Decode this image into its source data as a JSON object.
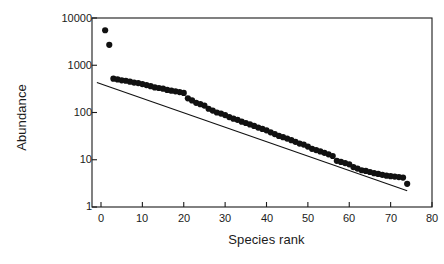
{
  "chart_data": {
    "type": "scatter",
    "title": "",
    "xlabel": "Species rank",
    "ylabel": "Abundance",
    "xlim": [
      -5,
      80
    ],
    "ylim": [
      1,
      10000
    ],
    "yscale": "log",
    "xticks": [
      0,
      10,
      20,
      30,
      40,
      50,
      60,
      70,
      80
    ],
    "yticks": [
      1,
      10,
      100,
      1000,
      10000
    ],
    "ytick_labels": [
      "1",
      "10",
      "100",
      "1000",
      "10000"
    ],
    "grid": false,
    "legend": null,
    "marker": "filled-circle",
    "marker_color": "#111111",
    "series": [
      {
        "name": "Species abundance",
        "x": [
          1,
          2,
          3,
          4,
          5,
          6,
          7,
          8,
          9,
          10,
          11,
          12,
          13,
          14,
          15,
          16,
          17,
          18,
          19,
          20,
          21,
          22,
          23,
          24,
          25,
          26,
          27,
          28,
          29,
          30,
          31,
          32,
          33,
          34,
          35,
          36,
          37,
          38,
          39,
          40,
          41,
          42,
          43,
          44,
          45,
          46,
          47,
          48,
          49,
          50,
          51,
          52,
          53,
          54,
          55,
          56,
          57,
          58,
          59,
          60,
          61,
          62,
          63,
          64,
          65,
          66,
          67,
          68,
          69,
          70,
          71,
          72,
          73,
          74
        ],
        "y": [
          5500,
          2700,
          520,
          500,
          480,
          470,
          450,
          430,
          420,
          400,
          380,
          360,
          340,
          330,
          320,
          300,
          290,
          280,
          270,
          260,
          200,
          180,
          160,
          150,
          140,
          120,
          110,
          100,
          95,
          88,
          80,
          74,
          70,
          64,
          60,
          56,
          52,
          48,
          45,
          42,
          38,
          35,
          32,
          30,
          28,
          26,
          24,
          22,
          21,
          19,
          17,
          16,
          15,
          14,
          13,
          12,
          9.5,
          9,
          8.5,
          8,
          7,
          6.5,
          6,
          5.8,
          5.5,
          5.2,
          5,
          4.8,
          4.6,
          4.5,
          4.4,
          4.3,
          4.2,
          3.1
        ]
      }
    ],
    "trendline": {
      "name": "fitted regression line",
      "x0": -1,
      "y0": 430,
      "x1": 74,
      "y1": 2.2,
      "color": "#111111"
    }
  },
  "axes": {
    "ylabel": "Abundance",
    "xlabel": "Species rank",
    "ytick_labels": [
      "10000",
      "1000",
      "100",
      "10",
      "1"
    ],
    "xtick_labels": [
      "0",
      "10",
      "20",
      "30",
      "40",
      "50",
      "60",
      "70",
      "80"
    ]
  }
}
